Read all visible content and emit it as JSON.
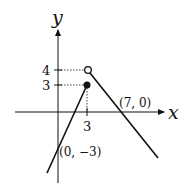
{
  "labels": {
    "y_axis": "y",
    "x_axis": "x",
    "tick_y4": "4",
    "tick_y3": "3",
    "tick_x3": "3",
    "point_x_intercept": "(7, 0)",
    "point_y_intercept": "(0, −3)"
  },
  "colors": {
    "ink": "#111111",
    "background": "#ffffff"
  }
}
